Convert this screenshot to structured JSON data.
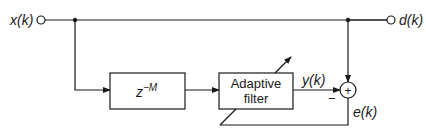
{
  "diagram": {
    "signals": {
      "input": "x(k)",
      "desired": "d(k)",
      "output": "y(k)",
      "error": "e(k)"
    },
    "blocks": {
      "delay": {
        "base": "z",
        "exponent": "−M"
      },
      "adaptive_filter": {
        "line1": "Adaptive",
        "line2": "filter"
      }
    },
    "summer": {
      "plus_sign": "+",
      "minus_sign": "−"
    },
    "colors": {
      "stroke": "#1a1a1a",
      "background": "#ffffff"
    }
  }
}
